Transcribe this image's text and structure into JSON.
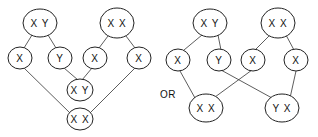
{
  "diagram": {
    "connector_label": "OR",
    "left": {
      "nodes": [
        {
          "id": "l-parent-xy",
          "label": "X Y"
        },
        {
          "id": "l-parent-xx",
          "label": "X X"
        },
        {
          "id": "l-gamete-x1",
          "label": "X"
        },
        {
          "id": "l-gamete-y",
          "label": "Y"
        },
        {
          "id": "l-gamete-x2",
          "label": "X"
        },
        {
          "id": "l-gamete-x3",
          "label": "X"
        },
        {
          "id": "l-offspring-xy",
          "label": "X Y"
        },
        {
          "id": "l-offspring-xx",
          "label": "X X"
        }
      ]
    },
    "right": {
      "nodes": [
        {
          "id": "r-parent-xy",
          "label": "X Y"
        },
        {
          "id": "r-parent-xx",
          "label": "X X"
        },
        {
          "id": "r-gamete-x1",
          "label": "X"
        },
        {
          "id": "r-gamete-y",
          "label": "Y"
        },
        {
          "id": "r-gamete-x2",
          "label": "X"
        },
        {
          "id": "r-gamete-x3",
          "label": "X"
        },
        {
          "id": "r-offspring-xx",
          "label": "X X"
        },
        {
          "id": "r-offspring-yx",
          "label": "Y X"
        }
      ]
    }
  }
}
